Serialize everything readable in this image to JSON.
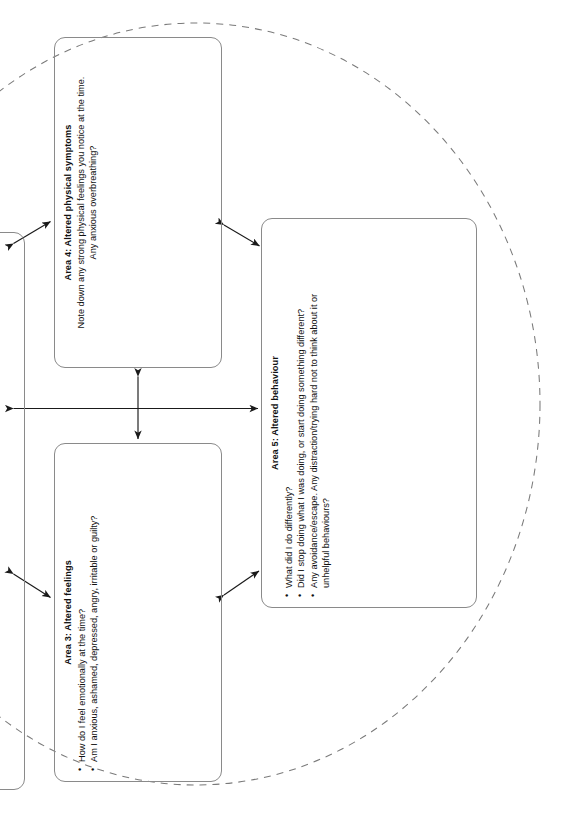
{
  "document": {
    "type": "five-areas-cbt-worksheet",
    "orientation": "rotated-90-ccw",
    "page_background": "#ffffff",
    "line_color": "#8a8a8a",
    "arrow_color": "#1a1a1a",
    "dashed_outline_color": "#7a7a7a"
  },
  "boxes": {
    "area4": {
      "title": "Area 4: Altered physical symptoms",
      "subtitle_line1": "Note down any strong physical feelings you notice at the time.",
      "subtitle_line2": "Any anxious overbreathing?"
    },
    "area3": {
      "title": "Area 3: Altered feelings",
      "bullets": [
        "How do I feel emotionally at the time?",
        "Am I anxious, ashamed, depressed, angry, irritable or guilty?"
      ]
    },
    "area5": {
      "title": "Area 5: Altered behaviour",
      "bullets": [
        "What did I do differently?",
        "Did I stop doing what I was doing, or start doing something different?",
        "Any avoidance/escape. Any distraction/trying hard not to think about it or"
      ],
      "bullet_3_continuation": "unhelpful behaviours?"
    },
    "partial_left": {
      "label": ""
    }
  },
  "connectors": [
    {
      "name": "arrow-area4-to-left-box",
      "style": "double-headed",
      "direction": "diagonal"
    },
    {
      "name": "arrow-area3-to-left-box",
      "style": "double-headed",
      "direction": "diagonal"
    },
    {
      "name": "arrow-area4-to-area5",
      "style": "double-headed",
      "direction": "diagonal"
    },
    {
      "name": "arrow-area3-to-area5",
      "style": "double-headed",
      "direction": "diagonal"
    },
    {
      "name": "arrow-area4-to-area3",
      "style": "double-headed",
      "direction": "vertical"
    },
    {
      "name": "arrow-left-box-to-area5",
      "style": "double-headed",
      "direction": "horizontal"
    }
  ]
}
